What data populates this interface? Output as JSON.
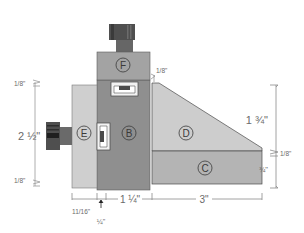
{
  "diagram": {
    "type": "technical-drawing",
    "colors": {
      "part_b": "#8f8f8f",
      "part_f": "#a3a3a3",
      "part_e": "#cfcfcf",
      "part_d": "#cdcdcd",
      "part_c": "#b4b4b4",
      "knob_dark": "#555555",
      "outline": "#4a4a4a",
      "dimension_line": "#8a8a8a"
    },
    "parts": [
      {
        "id": "B",
        "label": "B"
      },
      {
        "id": "C",
        "label": "C"
      },
      {
        "id": "D",
        "label": "D"
      },
      {
        "id": "E",
        "label": "E"
      },
      {
        "id": "F",
        "label": "F"
      }
    ],
    "dimensions": {
      "left_top_gap": "1/8\"",
      "left_height": "2 ½\"",
      "left_bottom_gap": "1/8\"",
      "top_gap_f": "1/8\"",
      "right_upper_height": "1 ¾\"",
      "right_middle_gap": "1/8\"",
      "right_lower_height": "¾\"",
      "bottom_e_width": "11/16\"",
      "bottom_gap": "¼\"",
      "bottom_b_width": "1 ¼\"",
      "bottom_cd_width": "3\""
    }
  }
}
